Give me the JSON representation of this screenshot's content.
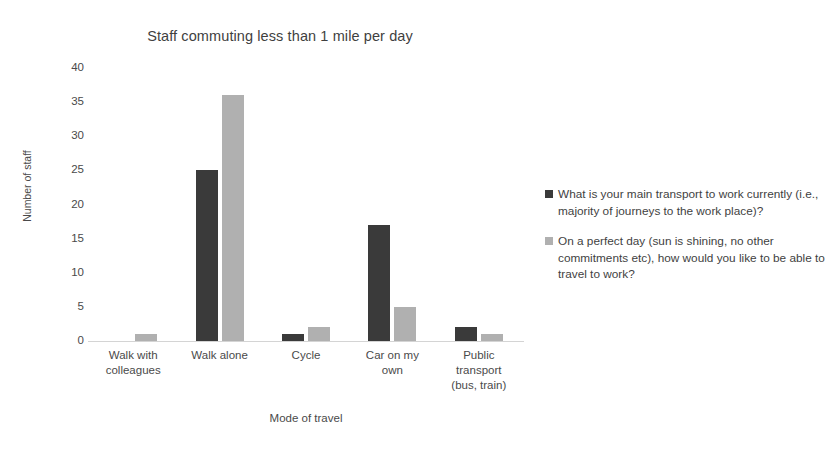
{
  "chart_data": {
    "type": "bar",
    "title": "Staff commuting less than 1 mile per day",
    "xlabel": "Mode of travel",
    "ylabel": "Number of staff",
    "ylim": [
      0,
      40
    ],
    "yticks": [
      40,
      35,
      30,
      25,
      20,
      15,
      10,
      5,
      0
    ],
    "grid": false,
    "legend_position": "right",
    "categories": [
      "Walk with colleagues",
      "Walk alone",
      "Cycle",
      "Car on my own",
      "Public transport (bus, train)"
    ],
    "series": [
      {
        "name": "What is your main transport to work currently (i.e., majority of journeys to the work place)?",
        "color": "#3a3a3a",
        "values": [
          0,
          25,
          1,
          17,
          2
        ]
      },
      {
        "name": "On a perfect day (sun is shining, no other commitments etc), how would you like to be able to travel to work?",
        "color": "#b0b0b0",
        "values": [
          1,
          36,
          2,
          5,
          1
        ]
      }
    ]
  },
  "xtick_lines": [
    [
      "Walk with",
      "colleagues"
    ],
    [
      "Walk alone"
    ],
    [
      "Cycle"
    ],
    [
      "Car on my",
      "own"
    ],
    [
      "Public",
      "transport",
      "(bus, train)"
    ]
  ]
}
